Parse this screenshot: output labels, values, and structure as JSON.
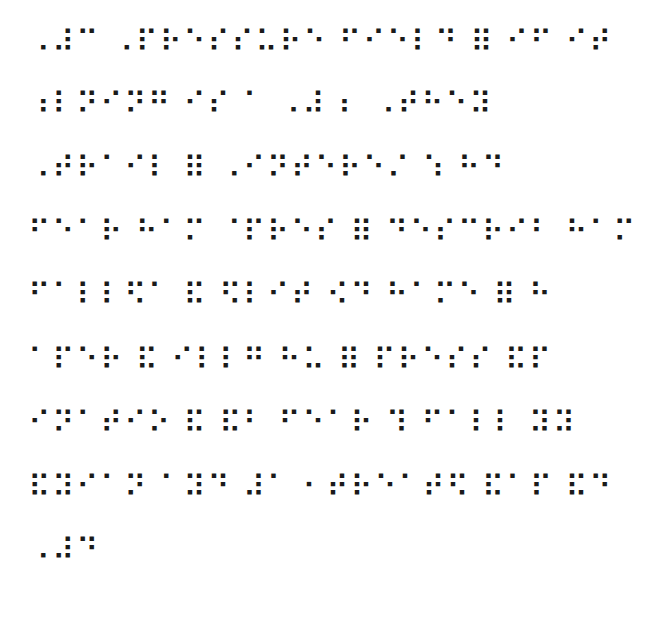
{
  "document": {
    "type": "braille-text",
    "lines": [
      "⠠⠼⠉ ⠠⠏⠗⠑⠎⠎⠥⠗⠑ ⠋⠊⠑⠇⠙ ⠿ ⠊⠋ ⠊⠞",
      "⠰⠇⠝⠊⠝⠛ ⠊⠎ ⠁ ⠠⠼ ⠆ ⠠⠞⠓⠑⠽",
      "⠠⠞⠗⠁⠊⠇ ⠿ ⠠⠊⠝⠞⠑⠗⠑⠌ ⠱ ⠓⠙",
      "⠋⠑⠁⠗ ⠓⠁⠍ ⠈⠏⠗⠑⠎ ⠿ ⠙⠑⠎⠉⠗⠊⠃ ⠓⠁⠍",
      "⠋⠁⠇⠇⠫⠁ ⠯ ⠫⠇⠊⠞ ⠪⠙ ⠓⠁⠍⠑ ⠿ ⠓",
      "⠁⠏⠑⠗ ⠯ ⠊⠇⠇⠛ ⠓⠥ ⠿ ⠏⠗⠑⠎⠎ ⠯⠏",
      "⠊⠝⠁⠞⠊⠕ ⠯ ⠯⠃ ⠋⠑⠁⠗ ⠹ ⠋⠁⠇⠇ ⠽⠽",
      "⠯⠽⠊⠁⠝ ⠁⠽⠙ ⠼⠁ ⠂⠞⠗⠑⠁⠞⠫ ⠯⠁⠏ ⠯⠙",
      "⠠⠼⠙"
    ]
  }
}
